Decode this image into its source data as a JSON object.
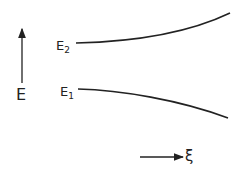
{
  "axes": {
    "y_label": "E",
    "x_label": "ξ"
  },
  "curves": [
    {
      "name": "E2",
      "base": "E",
      "subscript": "2",
      "trend": "increasing"
    },
    {
      "name": "E1",
      "base": "E",
      "subscript": "1",
      "trend": "decreasing"
    }
  ],
  "colors": {
    "line": "#222222",
    "background": "#ffffff"
  }
}
